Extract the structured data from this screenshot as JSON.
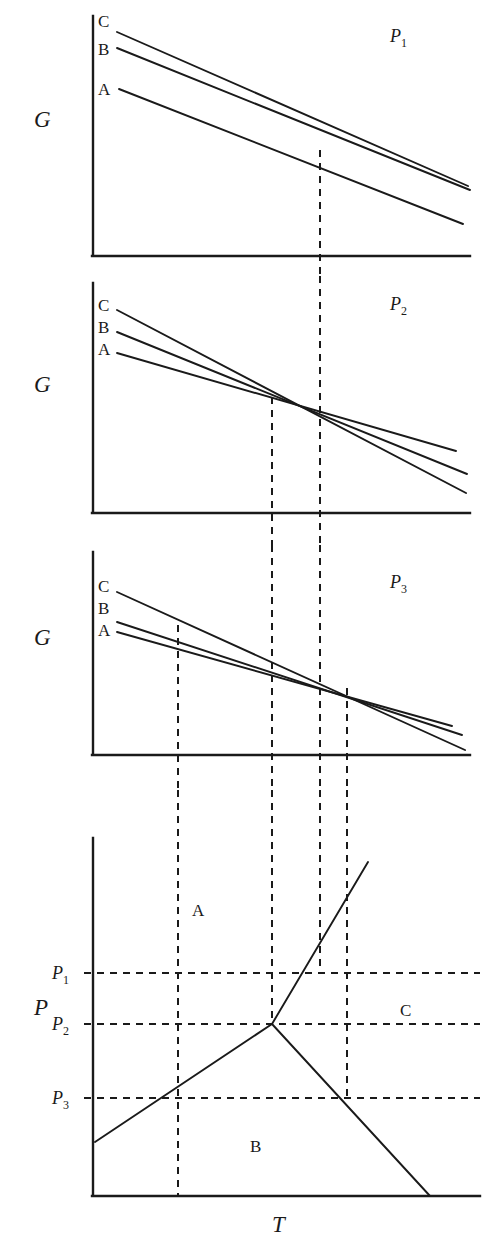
{
  "figure": {
    "kind": "thermodynamic-phase-figure",
    "line_color": "#1a1a1a",
    "background": "#ffffff"
  },
  "panels": [
    {
      "id": "panel-p1",
      "tag": "P",
      "tag_sub": "1",
      "y_axis_label": "G",
      "curve_labels": [
        "C",
        "B",
        "A"
      ],
      "x_axis_label": "",
      "frame": {
        "x0": 92,
        "x1": 470,
        "ybase": 256,
        "ytop": 16
      },
      "curves": [
        {
          "name": "C",
          "x1": 117,
          "y1": 32,
          "x2": 468,
          "y2": 186
        },
        {
          "name": "B",
          "x1": 117,
          "y1": 48,
          "x2": 470,
          "y2": 190
        },
        {
          "name": "A",
          "x1": 119,
          "y1": 89,
          "x2": 463,
          "y2": 224
        }
      ],
      "curve_label_positions": [
        {
          "text": "C",
          "x": 98,
          "y": 27
        },
        {
          "text": "B",
          "x": 98,
          "y": 55
        },
        {
          "text": "A",
          "x": 98,
          "y": 95
        }
      ],
      "tag_position": {
        "x": 390,
        "y": 42
      },
      "verticals": [
        320
      ],
      "y_label_position": {
        "x": 34,
        "y": 127
      }
    },
    {
      "id": "panel-p2",
      "tag": "P",
      "tag_sub": "2",
      "y_axis_label": "G",
      "curve_labels": [
        "C",
        "B",
        "A"
      ],
      "frame": {
        "x0": 92,
        "x1": 470,
        "ybase": 513,
        "ytop": 283
      },
      "curves": [
        {
          "name": "C",
          "x1": 117,
          "y1": 310,
          "x2": 466,
          "y2": 493
        },
        {
          "name": "B",
          "x1": 117,
          "y1": 332,
          "x2": 467,
          "y2": 474
        },
        {
          "name": "A",
          "x1": 117,
          "y1": 353,
          "x2": 456,
          "y2": 451
        }
      ],
      "curve_label_positions": [
        {
          "text": "C",
          "x": 98,
          "y": 311
        },
        {
          "text": "B",
          "x": 98,
          "y": 333
        },
        {
          "text": "A",
          "x": 98,
          "y": 355
        }
      ],
      "tag_position": {
        "x": 390,
        "y": 310
      },
      "verticals": [
        272,
        320
      ],
      "convergence_point": {
        "x": 272,
        "y": 397
      },
      "y_label_position": {
        "x": 34,
        "y": 392
      }
    },
    {
      "id": "panel-p3",
      "tag": "P",
      "tag_sub": "3",
      "y_axis_label": "G",
      "curve_labels": [
        "C",
        "B",
        "A"
      ],
      "frame": {
        "x0": 92,
        "x1": 470,
        "ybase": 755,
        "ytop": 552
      },
      "curves": [
        {
          "name": "C",
          "x1": 117,
          "y1": 592,
          "x2": 465,
          "y2": 750
        },
        {
          "name": "B",
          "x1": 117,
          "y1": 622,
          "x2": 462,
          "y2": 735
        },
        {
          "name": "A",
          "x1": 117,
          "y1": 632,
          "x2": 452,
          "y2": 726
        }
      ],
      "curve_label_positions": [
        {
          "text": "C",
          "x": 98,
          "y": 592
        },
        {
          "text": "B",
          "x": 98,
          "y": 614
        },
        {
          "text": "A",
          "x": 98,
          "y": 636
        }
      ],
      "tag_position": {
        "x": 390,
        "y": 588
      },
      "verticals": [
        178,
        272,
        320,
        347
      ],
      "y_label_position": {
        "x": 34,
        "y": 645
      }
    }
  ],
  "phase_diagram": {
    "id": "panel-phase",
    "y_axis_label": "P",
    "x_axis_label": "T",
    "frame": {
      "x0": 92,
      "x1": 480,
      "ybase": 1196,
      "ytop": 838
    },
    "y_axis_label_position": {
      "x": 34,
      "y": 1015
    },
    "x_axis_label_position": {
      "x": 272,
      "y": 1232
    },
    "pressure_ticks": [
      {
        "label": "P",
        "sub": "1",
        "y": 973,
        "x_text": 52
      },
      {
        "label": "P",
        "sub": "2",
        "y": 1024,
        "x_text": 52
      },
      {
        "label": "P",
        "sub": "3",
        "y": 1098,
        "x_text": 52
      }
    ],
    "region_labels": [
      {
        "text": "A",
        "x": 192,
        "y": 916
      },
      {
        "text": "B",
        "x": 250,
        "y": 1152
      },
      {
        "text": "C",
        "x": 400,
        "y": 1016
      }
    ],
    "triple_point": {
      "x": 272,
      "y": 1024
    },
    "boundaries": [
      {
        "name": "A-B",
        "x1": 95,
        "y1": 1142,
        "x2": 272,
        "y2": 1024
      },
      {
        "name": "B-C",
        "x1": 272,
        "y1": 1024,
        "x2": 430,
        "y2": 1196
      },
      {
        "name": "A-C",
        "x1": 272,
        "y1": 1024,
        "x2": 368,
        "y2": 862
      }
    ],
    "verticals": [
      178,
      272,
      320,
      347
    ],
    "horizontals": [
      973,
      1024,
      1098
    ]
  }
}
